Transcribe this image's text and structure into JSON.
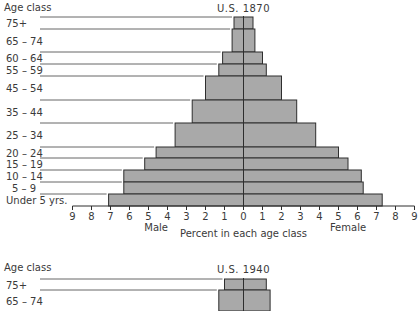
{
  "chart_data": [
    {
      "type": "bar",
      "subtype": "population-pyramid",
      "title": "U.S. 1870",
      "y_header": "Age class",
      "xlabel": "Percent in each age class",
      "left_label": "Male",
      "right_label": "Female",
      "x_ticks_left": [
        9,
        8,
        7,
        6,
        5,
        4,
        3,
        2,
        1
      ],
      "x_ticks_right": [
        0,
        1,
        2,
        3,
        4,
        5,
        6,
        7,
        8,
        9
      ],
      "xlim": [
        -9,
        9
      ],
      "grid": false,
      "categories": [
        "75+",
        "65 – 74",
        "60 – 64",
        "55 – 59",
        "45 – 54",
        "35 – 44",
        "25 – 34",
        "20 – 24",
        "15 – 19",
        "10 – 14",
        "5 – 9",
        "Under 5 yrs."
      ],
      "series": [
        {
          "name": "Male",
          "values": [
            0.5,
            0.6,
            1.1,
            1.3,
            2.0,
            2.7,
            3.6,
            4.6,
            5.2,
            6.3,
            6.3,
            7.1
          ]
        },
        {
          "name": "Female",
          "values": [
            0.5,
            0.6,
            1.0,
            1.2,
            2.0,
            2.8,
            3.8,
            5.0,
            5.5,
            6.2,
            6.3,
            7.3
          ]
        }
      ],
      "row_tops_px": [
        17,
        29,
        52,
        64,
        76,
        100,
        123,
        147,
        158,
        170,
        182,
        194
      ],
      "row_bottom_px": 206
    },
    {
      "type": "bar",
      "subtype": "population-pyramid",
      "title": "U.S. 1940",
      "y_header": "Age class",
      "categories": [
        "75+",
        "65 – 74"
      ],
      "series": [
        {
          "name": "Male",
          "values": [
            1.0,
            1.3
          ]
        },
        {
          "name": "Female",
          "values": [
            1.2,
            1.4
          ]
        }
      ],
      "row_tops_px": [
        279,
        290
      ],
      "row_bottom_px": 311,
      "partial": true
    }
  ],
  "colors": {
    "bar_fill": "#a9a9a9",
    "bar_stroke": "#2e2e2e",
    "leader_line": "#555555",
    "text": "#3a3a3a"
  }
}
